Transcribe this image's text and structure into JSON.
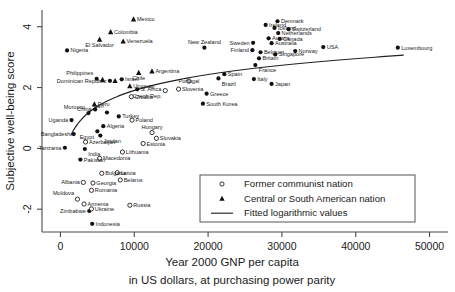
{
  "chart_data": {
    "type": "scatter",
    "title": "",
    "xlabel": "Year 2000 GNP per capita",
    "xlabel2": "in US dollars, at purchasing power parity",
    "ylabel": "Subjective well-being score",
    "xlim": [
      -2500,
      52500
    ],
    "ylim": [
      -2.75,
      4.55
    ],
    "xticks": [
      0,
      10000,
      20000,
      30000,
      40000,
      50000
    ],
    "xticklabels": [
      "0",
      "10000",
      "20000",
      "30000",
      "40000",
      "50000"
    ],
    "yticks": [
      4,
      2,
      0,
      -2
    ],
    "yticklabels": [
      "4",
      "2",
      "0",
      "-2"
    ],
    "grid": false,
    "legend_position": "bottom-right",
    "legend": [
      {
        "marker": "open-circle",
        "label": "Former communist nation"
      },
      {
        "marker": "filled-triangle",
        "label": "Central or South American nation"
      },
      {
        "marker": "line",
        "label": "Fitted logarithmic values"
      }
    ],
    "series": [
      {
        "name": "Other nation",
        "marker": "filled-circle",
        "points": [
          {
            "label": "Nigeria",
            "x": 896,
            "y": 3.22,
            "lx": "right",
            "ly": "mid"
          },
          {
            "label": "New Zealand",
            "x": 19500,
            "y": 3.31,
            "lx": "center",
            "ly": "above"
          },
          {
            "label": "Ireland",
            "x": 27800,
            "y": 4.06,
            "lx": "right",
            "ly": "mid"
          },
          {
            "label": "Denmark",
            "x": 29400,
            "y": 4.18,
            "lx": "right",
            "ly": "mid"
          },
          {
            "label": "Iceland",
            "x": 29000,
            "y": 3.96,
            "lx": "right",
            "ly": "mid"
          },
          {
            "label": "Switzerland",
            "x": 30900,
            "y": 3.92,
            "lx": "right",
            "ly": "mid"
          },
          {
            "label": "Netherlands",
            "x": 29500,
            "y": 3.79,
            "lx": "right",
            "ly": "mid"
          },
          {
            "label": "Austria",
            "x": 28200,
            "y": 3.62,
            "lx": "right",
            "ly": "mid"
          },
          {
            "label": "Canada",
            "x": 29700,
            "y": 3.6,
            "lx": "right",
            "ly": "mid"
          },
          {
            "label": "Australia",
            "x": 28600,
            "y": 3.46,
            "lx": "right",
            "ly": "mid"
          },
          {
            "label": "Sweden",
            "x": 26100,
            "y": 3.47,
            "lx": "left",
            "ly": "mid"
          },
          {
            "label": "Finland",
            "x": 26000,
            "y": 3.23,
            "lx": "left",
            "ly": "mid"
          },
          {
            "label": "Belgium",
            "x": 27100,
            "y": 3.16,
            "lx": "right",
            "ly": "mid"
          },
          {
            "label": "Singapore",
            "x": 29100,
            "y": 3.09,
            "lx": "right",
            "ly": "mid"
          },
          {
            "label": "Norway",
            "x": 31800,
            "y": 3.2,
            "lx": "right",
            "ly": "mid"
          },
          {
            "label": "USA",
            "x": 35600,
            "y": 3.33,
            "lx": "right",
            "ly": "mid"
          },
          {
            "label": "Luxembourg",
            "x": 45700,
            "y": 3.31,
            "lx": "right",
            "ly": "mid"
          },
          {
            "label": "Britain",
            "x": 26900,
            "y": 2.96,
            "lx": "right",
            "ly": "mid"
          },
          {
            "label": "France",
            "x": 26400,
            "y": 2.74,
            "lx": "right",
            "ly": "below"
          },
          {
            "label": "Italy",
            "x": 26200,
            "y": 2.28,
            "lx": "right",
            "ly": "mid"
          },
          {
            "label": "Japan",
            "x": 28600,
            "y": 2.12,
            "lx": "right",
            "ly": "mid"
          },
          {
            "label": "Spain",
            "x": 22200,
            "y": 2.44,
            "lx": "right",
            "ly": "mid"
          },
          {
            "label": "Brazil",
            "x": 21400,
            "y": 2.3,
            "lx": "right",
            "ly": "below"
          },
          {
            "label": "Greece",
            "x": 19800,
            "y": 1.8,
            "lx": "right",
            "ly": "mid"
          },
          {
            "label": "South Korea",
            "x": 19300,
            "y": 1.47,
            "lx": "right",
            "ly": "mid"
          },
          {
            "label": "Philippines",
            "x": 4900,
            "y": 2.29,
            "lx": "left",
            "ly": "above"
          },
          {
            "label": "Dominican Republic",
            "x": 6700,
            "y": 2.22,
            "lx": "left",
            "ly": "mid"
          },
          {
            "label": "S. Africa",
            "x": 10400,
            "y": 1.94,
            "lx": "right",
            "ly": "mid"
          },
          {
            "label": "Israel",
            "x": 8300,
            "y": 2.27,
            "lx": "right",
            "ly": "mid"
          },
          {
            "label": "China",
            "x": 4700,
            "y": 1.28,
            "lx": "left",
            "ly": "mid"
          },
          {
            "label": "Morocco",
            "x": 3800,
            "y": 1.16,
            "lx": "left",
            "ly": "above"
          },
          {
            "label": "Iran",
            "x": 6300,
            "y": 1.18,
            "lx": "left",
            "ly": "above"
          },
          {
            "label": "Turkey",
            "x": 7900,
            "y": 1.05,
            "lx": "right",
            "ly": "mid"
          },
          {
            "label": "Algeria",
            "x": 5800,
            "y": 0.73,
            "lx": "right",
            "ly": "mid"
          },
          {
            "label": "Egypt",
            "x": 5000,
            "y": 0.56,
            "lx": "left",
            "ly": "below"
          },
          {
            "label": "Jordan",
            "x": 5400,
            "y": 0.42,
            "lx": "right",
            "ly": "below"
          },
          {
            "label": "Uganda",
            "x": 1500,
            "y": 0.93,
            "lx": "left",
            "ly": "mid"
          },
          {
            "label": "Bangladesh",
            "x": 1800,
            "y": 0.47,
            "lx": "left",
            "ly": "mid"
          },
          {
            "label": "Tanzania",
            "x": 600,
            "y": 0.02,
            "lx": "left",
            "ly": "mid"
          },
          {
            "label": "India",
            "x": 3300,
            "y": -0.02,
            "lx": "right",
            "ly": "below"
          },
          {
            "label": "Pakistan",
            "x": 2700,
            "y": -0.37,
            "lx": "right",
            "ly": "mid"
          },
          {
            "label": "Zimbabwe",
            "x": 3900,
            "y": -2.06,
            "lx": "left",
            "ly": "mid"
          },
          {
            "label": "Indonesia",
            "x": 4300,
            "y": -2.48,
            "lx": "right",
            "ly": "mid"
          }
        ]
      },
      {
        "name": "Central or South American nation",
        "marker": "filled-triangle",
        "points": [
          {
            "label": "Mexico",
            "x": 9900,
            "y": 4.25,
            "lx": "right",
            "ly": "mid"
          },
          {
            "label": "Colombia",
            "x": 6800,
            "y": 3.83,
            "lx": "right",
            "ly": "mid"
          },
          {
            "label": "Venezuela",
            "x": 8500,
            "y": 3.52,
            "lx": "right",
            "ly": "mid"
          },
          {
            "label": "El Salvador",
            "x": 5300,
            "y": 3.58,
            "lx": "center",
            "ly": "below"
          },
          {
            "label": "Argentina",
            "x": 12400,
            "y": 2.54,
            "lx": "right",
            "ly": "mid"
          },
          {
            "label": "Chile",
            "x": 10600,
            "y": 2.49,
            "lx": "center",
            "ly": "below"
          },
          {
            "label": "Uruguay",
            "x": 9400,
            "y": 2.05,
            "lx": "right",
            "ly": "mid"
          },
          {
            "label": "Peru",
            "x": 4600,
            "y": 1.45,
            "lx": "right",
            "ly": "mid"
          },
          {
            "label": "",
            "x": 5700,
            "y": 2.26,
            "lx": "right",
            "ly": "mid"
          },
          {
            "label": "",
            "x": 7400,
            "y": 2.22,
            "lx": "right",
            "ly": "mid"
          }
        ]
      },
      {
        "name": "Former communist nation",
        "marker": "open-circle",
        "points": [
          {
            "label": "Poland",
            "x": 9700,
            "y": 0.93,
            "lx": "right",
            "ly": "mid"
          },
          {
            "label": "Hungary",
            "x": 12400,
            "y": 0.52,
            "lx": "center",
            "ly": "above"
          },
          {
            "label": "Slovakia",
            "x": 13000,
            "y": 0.33,
            "lx": "right",
            "ly": "mid"
          },
          {
            "label": "Estonia",
            "x": 11200,
            "y": 0.16,
            "lx": "right",
            "ly": "mid"
          },
          {
            "label": "Czech Rep.",
            "x": 14200,
            "y": 1.9,
            "lx": "left",
            "ly": "below"
          },
          {
            "label": "Slovenia",
            "x": 16000,
            "y": 1.95,
            "lx": "right",
            "ly": "mid"
          },
          {
            "label": "Portugal",
            "x": 17400,
            "y": 2.21,
            "lx": "center",
            "ly": "mid"
          },
          {
            "label": "Croatia",
            "x": 9600,
            "y": 1.7,
            "lx": "right",
            "ly": "mid"
          },
          {
            "label": "Lithuania",
            "x": 8400,
            "y": -0.12,
            "lx": "right",
            "ly": "mid"
          },
          {
            "label": "Macedonia",
            "x": 5300,
            "y": -0.33,
            "lx": "right",
            "ly": "mid"
          },
          {
            "label": "Azerbaijan",
            "x": 3400,
            "y": 0.21,
            "lx": "right",
            "ly": "mid"
          },
          {
            "label": "Bulgaria",
            "x": 5600,
            "y": -0.82,
            "lx": "right",
            "ly": "mid"
          },
          {
            "label": "Latvia",
            "x": 7700,
            "y": -0.8,
            "lx": "right",
            "ly": "mid"
          },
          {
            "label": "Belarus",
            "x": 8100,
            "y": -1.04,
            "lx": "right",
            "ly": "mid"
          },
          {
            "label": "Georgia",
            "x": 4400,
            "y": -1.14,
            "lx": "right",
            "ly": "mid"
          },
          {
            "label": "Albania",
            "x": 3100,
            "y": -1.12,
            "lx": "left",
            "ly": "mid"
          },
          {
            "label": "Romania",
            "x": 4200,
            "y": -1.38,
            "lx": "right",
            "ly": "mid"
          },
          {
            "label": "Moldova",
            "x": 2300,
            "y": -1.67,
            "lx": "left",
            "ly": "above"
          },
          {
            "label": "Armenia",
            "x": 3200,
            "y": -1.83,
            "lx": "right",
            "ly": "mid"
          },
          {
            "label": "Ukraine",
            "x": 4200,
            "y": -1.99,
            "lx": "right",
            "ly": "mid"
          },
          {
            "label": "Russia",
            "x": 9400,
            "y": -1.87,
            "lx": "right",
            "ly": "mid"
          }
        ]
      }
    ],
    "fit": {
      "name": "Fitted logarithmic values",
      "type": "logarithmic",
      "a": -5.05,
      "b": 0.755,
      "x_start": 1400,
      "x_end": 46500
    }
  }
}
